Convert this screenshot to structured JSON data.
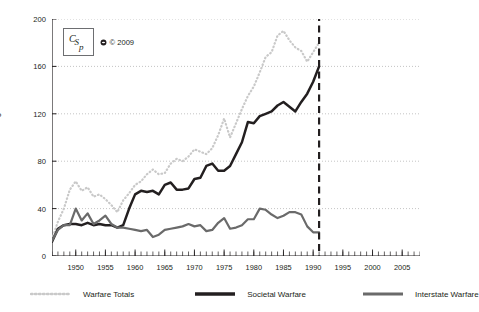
{
  "badge": {
    "logo_text": "CSP",
    "copyright_symbol": "copyright-icon",
    "copyright_text": "© 2009"
  },
  "legend": {
    "items": [
      {
        "label": "Warfare Totals",
        "style": "dotted",
        "color": "#c9c9c9"
      },
      {
        "label": "Societal Warfare",
        "style": "solid",
        "color": "#231f20"
      },
      {
        "label": "Interstate Warfare",
        "style": "solid",
        "color": "#6a6a6a"
      }
    ]
  },
  "chart_data": {
    "type": "line",
    "title": "",
    "xlabel": "",
    "ylabel": "Summed War Magnitude Scores",
    "xlim": [
      1946,
      2008
    ],
    "ylim": [
      0,
      200
    ],
    "yticks": [
      0,
      40,
      80,
      120,
      160,
      200
    ],
    "xticks": [
      1950,
      1955,
      1960,
      1965,
      1970,
      1975,
      1980,
      1985,
      1990,
      1995,
      2000,
      2005
    ],
    "x_minor_tick_step": 1,
    "grid": "horizontal-dotted",
    "legend_position": "bottom",
    "annotations": [
      {
        "type": "vline",
        "x": 1991,
        "style": "dashed",
        "color": "#231f20"
      }
    ],
    "x": [
      1946,
      1947,
      1948,
      1949,
      1950,
      1951,
      1952,
      1953,
      1954,
      1955,
      1956,
      1957,
      1958,
      1959,
      1960,
      1961,
      1962,
      1963,
      1964,
      1965,
      1966,
      1967,
      1968,
      1969,
      1970,
      1971,
      1972,
      1973,
      1974,
      1975,
      1976,
      1977,
      1978,
      1979,
      1980,
      1981,
      1982,
      1983,
      1984,
      1985,
      1986,
      1987,
      1988,
      1989,
      1990,
      1991
    ],
    "series": [
      {
        "name": "Warfare Totals",
        "color": "#c9c9c9",
        "style": "dotted",
        "values": [
          14,
          29,
          40,
          56,
          63,
          55,
          58,
          50,
          52,
          48,
          43,
          37,
          47,
          53,
          60,
          63,
          69,
          73,
          69,
          70,
          78,
          82,
          80,
          84,
          90,
          88,
          86,
          91,
          102,
          116,
          100,
          112,
          124,
          135,
          143,
          155,
          168,
          172,
          186,
          190,
          182,
          176,
          173,
          164,
          172,
          180
        ]
      },
      {
        "name": "Societal Warfare",
        "color": "#231f20",
        "style": "solid",
        "values": [
          12,
          23,
          26,
          27,
          27,
          26,
          28,
          26,
          27,
          26,
          26,
          24,
          26,
          40,
          52,
          55,
          54,
          55,
          52,
          60,
          62,
          56,
          56,
          57,
          65,
          66,
          76,
          78,
          72,
          72,
          76,
          86,
          96,
          113,
          112,
          118,
          120,
          122,
          127,
          130,
          126,
          122,
          130,
          137,
          147,
          160
        ]
      },
      {
        "name": "Interstate Warfare",
        "color": "#6a6a6a",
        "style": "solid",
        "values": [
          13,
          22,
          26,
          26,
          40,
          30,
          36,
          27,
          30,
          34,
          27,
          24,
          24,
          23,
          22,
          21,
          22,
          16,
          18,
          22,
          23,
          24,
          25,
          27,
          25,
          26,
          21,
          22,
          28,
          32,
          23,
          24,
          26,
          31,
          31,
          40,
          39,
          35,
          32,
          34,
          37,
          37,
          35,
          25,
          20,
          20
        ]
      }
    ]
  }
}
